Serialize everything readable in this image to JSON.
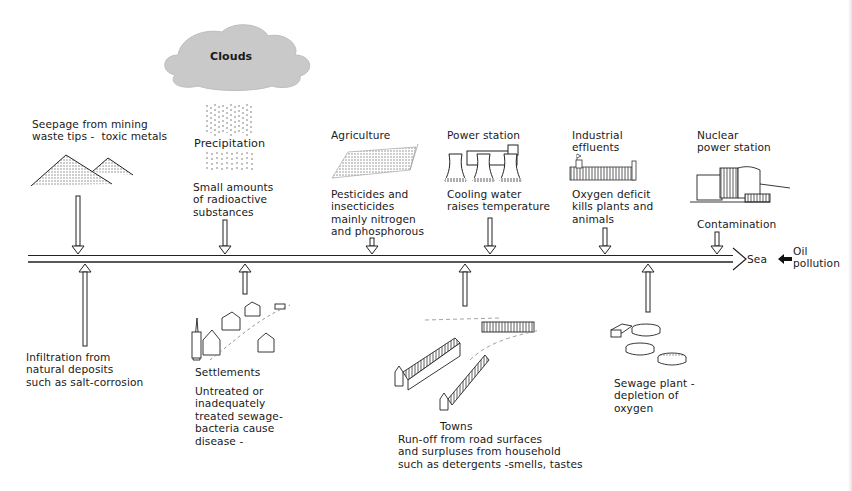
{
  "diagram": {
    "topic": "Sources of river water pollution",
    "river_end_label": "Sea",
    "sea_input": {
      "label": "Oil\npollution",
      "icon": "black-arrow-left-icon"
    }
  },
  "cloud": {
    "label": "Clouds",
    "icon": "cloud-icon",
    "color": "#c8c8c8"
  },
  "above_sources": [
    {
      "id": "mining",
      "title": "Seepage from mining\nwaste tips -  toxic metals",
      "description": "",
      "icon": "spoil-heap-icon",
      "arrow_x": 78
    },
    {
      "id": "precipitation",
      "title": "Precipitation",
      "description": "Small amounts\nof radioactive\nsubstances",
      "icon": "rain-icon",
      "arrow_x": 225
    },
    {
      "id": "agriculture",
      "title": "Agriculture",
      "description": "Pesticides and\ninsecticides\nmainly nitrogen\nand phosphorous",
      "icon": "field-icon",
      "arrow_x": 372
    },
    {
      "id": "power-station",
      "title": "Power station",
      "description": "Cooling water\nraises temperature",
      "icon": "cooling-tower-icon",
      "arrow_x": 490
    },
    {
      "id": "industrial",
      "title": "Industrial\neffluents",
      "description": "Oxygen deficit\nkills plants and\nanimals",
      "icon": "factory-icon",
      "arrow_x": 605
    },
    {
      "id": "nuclear",
      "title": "Nuclear\npower station",
      "description": "Contamination",
      "icon": "nuclear-plant-icon",
      "arrow_x": 717
    }
  ],
  "below_sources": [
    {
      "id": "infiltration",
      "title": "",
      "description": "Infiltration from\nnatural deposits\nsuch as salt-corrosion",
      "icon": "",
      "arrow_x": 85
    },
    {
      "id": "settlements",
      "title": "Settlements",
      "description": "Untreated or\ninadequately\ntreated sewage-\nbacteria cause\ndisease -",
      "icon": "village-icon",
      "arrow_x": 245
    },
    {
      "id": "towns",
      "title": "Towns",
      "description": "Run-off from road surfaces\nand surpluses from household\nsuch as detergents -smells, tastes",
      "icon": "town-icon",
      "arrow_x": 465
    },
    {
      "id": "sewage-plant",
      "title": "",
      "description": "Sewage plant -\ndepletion of\noxygen",
      "icon": "sewage-tanks-icon",
      "arrow_x": 648
    }
  ],
  "colors": {
    "ink": "#1a1a1a",
    "background": "#ffffff",
    "cloud": "#c8c8c8"
  }
}
